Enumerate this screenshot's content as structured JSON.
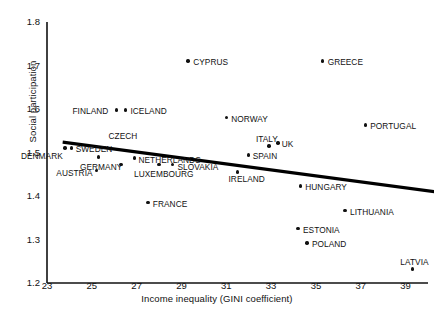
{
  "chart_data": {
    "type": "scatter",
    "title": "",
    "xlabel": "Income inequality (GINI coefficient)",
    "ylabel": "Social participation",
    "xlim": [
      23,
      40
    ],
    "ylim": [
      1.2,
      1.8
    ],
    "xticks": [
      23,
      25,
      27,
      29,
      31,
      33,
      35,
      37,
      39
    ],
    "yticks": [
      1.2,
      1.3,
      1.4,
      1.5,
      1.6,
      1.7,
      1.8
    ],
    "grid": false,
    "legend": false,
    "point_label_field": "country",
    "points": [
      {
        "country": "CYPRUS",
        "x": 29.3,
        "y": 1.71,
        "lx": 5,
        "ly": -4
      },
      {
        "country": "GREECE",
        "x": 35.3,
        "y": 1.71,
        "lx": 5,
        "ly": -4
      },
      {
        "country": "FINLAND",
        "x": 26.1,
        "y": 1.598,
        "lx": -44,
        "ly": -4
      },
      {
        "country": "ICELAND",
        "x": 26.5,
        "y": 1.598,
        "lx": 5,
        "ly": -4
      },
      {
        "country": "NORWAY",
        "x": 31.0,
        "y": 1.58,
        "lx": 5,
        "ly": -4
      },
      {
        "country": "PORTUGAL",
        "x": 37.2,
        "y": 1.563,
        "lx": 5,
        "ly": -4
      },
      {
        "country": "CZECH",
        "x": 25.3,
        "y": 1.49,
        "lx": 10,
        "ly": -26
      },
      {
        "country": "SWEDEN",
        "x": 24.1,
        "y": 1.51,
        "lx": 4,
        "ly": -4
      },
      {
        "country": "DENMARK",
        "x": 23.8,
        "y": 1.51,
        "lx": -44,
        "ly": 3
      },
      {
        "country": "ITALY",
        "x": 32.9,
        "y": 1.515,
        "lx": -13,
        "ly": -12
      },
      {
        "country": "UK",
        "x": 33.3,
        "y": 1.522,
        "lx": 4,
        "ly": -4
      },
      {
        "country": "SPAIN",
        "x": 32.0,
        "y": 1.494,
        "lx": 4,
        "ly": -4
      },
      {
        "country": "NETHERLANDS",
        "x": 26.9,
        "y": 1.487,
        "lx": 4,
        "ly": -3
      },
      {
        "country": "SLOVAKIA",
        "x": 28.6,
        "y": 1.472,
        "lx": 5,
        "ly": -3
      },
      {
        "country": "GERMANY",
        "x": 26.3,
        "y": 1.472,
        "lx": -41,
        "ly": -3
      },
      {
        "country": "LUXEMBOURG",
        "x": 28.0,
        "y": 1.472,
        "lx": -25,
        "ly": 4
      },
      {
        "country": "AUSTRIA",
        "x": 25.2,
        "y": 1.458,
        "lx": -40,
        "ly": -3
      },
      {
        "country": "IRELAND",
        "x": 31.5,
        "y": 1.455,
        "lx": -9,
        "ly": 2
      },
      {
        "country": "HUNGARY",
        "x": 34.3,
        "y": 1.423,
        "lx": 5,
        "ly": -4
      },
      {
        "country": "FRANCE",
        "x": 27.5,
        "y": 1.385,
        "lx": 5,
        "ly": -4
      },
      {
        "country": "LITHUANIA",
        "x": 36.3,
        "y": 1.366,
        "lx": 5,
        "ly": -4
      },
      {
        "country": "ESTONIA",
        "x": 34.2,
        "y": 1.325,
        "lx": 5,
        "ly": -4
      },
      {
        "country": "POLAND",
        "x": 34.6,
        "y": 1.292,
        "lx": 5,
        "ly": -4
      },
      {
        "country": "LATVIA",
        "x": 39.3,
        "y": 1.232,
        "lx": -12,
        "ly": -12
      }
    ],
    "trendline": {
      "x0": 23.7,
      "y0": 1.524,
      "x1": 40.3,
      "y1": 1.41,
      "slope_direction": "negative"
    }
  }
}
